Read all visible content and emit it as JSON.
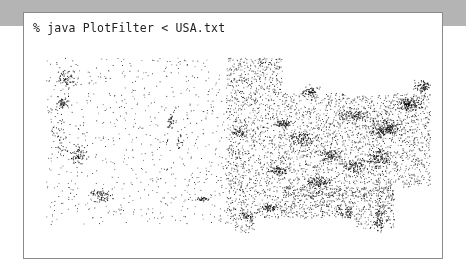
{
  "terminal": {
    "command": "% java PlotFilter < USA.txt"
  },
  "plot": {
    "description": "Scatter plot of US city locations",
    "dot_color": "#000000",
    "background": "#ffffff",
    "clusters": [
      [
        0.08,
        0.18,
        0.02,
        0.05,
        60
      ],
      [
        0.07,
        0.3,
        0.015,
        0.04,
        50
      ],
      [
        0.11,
        0.55,
        0.02,
        0.05,
        70
      ],
      [
        0.17,
        0.74,
        0.025,
        0.03,
        70
      ],
      [
        0.06,
        0.45,
        0.02,
        0.1,
        40
      ],
      [
        0.34,
        0.38,
        0.01,
        0.05,
        30
      ],
      [
        0.36,
        0.48,
        0.01,
        0.04,
        20
      ],
      [
        0.51,
        0.44,
        0.015,
        0.02,
        40
      ],
      [
        0.69,
        0.24,
        0.02,
        0.02,
        60
      ],
      [
        0.8,
        0.36,
        0.03,
        0.03,
        80
      ],
      [
        0.88,
        0.42,
        0.04,
        0.04,
        200
      ],
      [
        0.94,
        0.3,
        0.03,
        0.03,
        150
      ],
      [
        0.97,
        0.22,
        0.02,
        0.03,
        80
      ],
      [
        0.62,
        0.4,
        0.02,
        0.02,
        60
      ],
      [
        0.67,
        0.47,
        0.03,
        0.03,
        80
      ],
      [
        0.74,
        0.55,
        0.03,
        0.03,
        80
      ],
      [
        0.61,
        0.62,
        0.02,
        0.02,
        60
      ],
      [
        0.71,
        0.68,
        0.03,
        0.03,
        90
      ],
      [
        0.8,
        0.6,
        0.03,
        0.03,
        90
      ],
      [
        0.86,
        0.56,
        0.03,
        0.05,
        120
      ],
      [
        0.59,
        0.8,
        0.02,
        0.02,
        60
      ],
      [
        0.53,
        0.84,
        0.02,
        0.02,
        40
      ],
      [
        0.78,
        0.82,
        0.02,
        0.03,
        40
      ],
      [
        0.86,
        0.86,
        0.015,
        0.06,
        60
      ],
      [
        0.48,
        0.93,
        0.01,
        0.005,
        15
      ],
      [
        0.42,
        0.76,
        0.015,
        0.01,
        30
      ]
    ],
    "regions": [
      [
        0.03,
        0.08,
        0.48,
        0.9,
        700
      ],
      [
        0.48,
        0.08,
        0.62,
        0.92,
        1400
      ],
      [
        0.62,
        0.25,
        1.0,
        0.75,
        2200
      ],
      [
        0.62,
        0.7,
        0.92,
        0.9,
        900
      ]
    ]
  }
}
